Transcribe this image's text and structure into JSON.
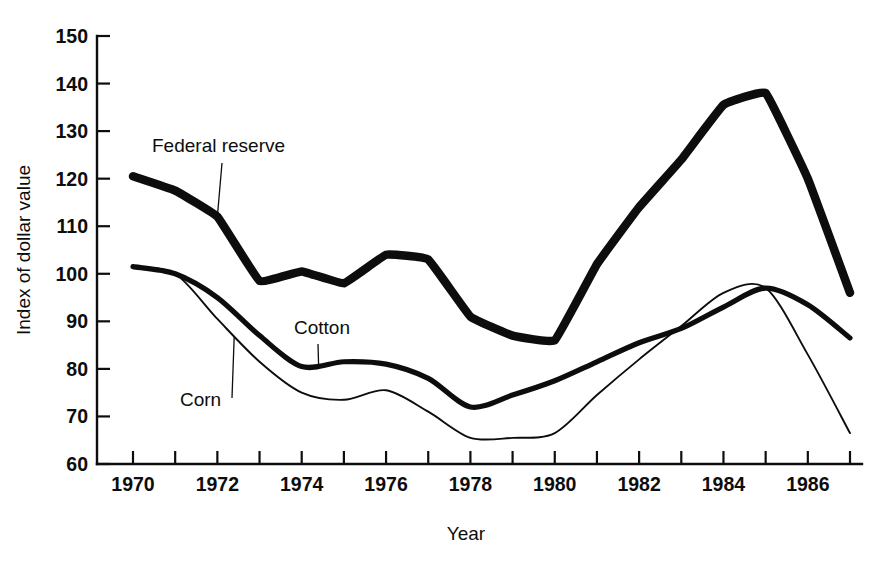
{
  "chart_data": {
    "type": "line",
    "title": "",
    "xlabel": "Year",
    "ylabel": "Index of dollar value",
    "xlim": [
      1970,
      1987
    ],
    "ylim": [
      60,
      150
    ],
    "grid": false,
    "legend_position": "inline-annotations",
    "x": [
      1970,
      1971,
      1972,
      1973,
      1974,
      1975,
      1976,
      1977,
      1978,
      1979,
      1980,
      1981,
      1982,
      1983,
      1984,
      1985,
      1986,
      1987
    ],
    "x_tick_labels": [
      "1970",
      "",
      "1972",
      "",
      "1974",
      "",
      "1976",
      "",
      "1978",
      "",
      "1980",
      "",
      "1982",
      "",
      "1984",
      "",
      "1986",
      ""
    ],
    "x_major_labels": [
      "1970",
      "1972",
      "1974",
      "1976",
      "1978",
      "1980",
      "1982",
      "1984",
      "1986"
    ],
    "y_ticks": [
      60,
      70,
      80,
      90,
      100,
      110,
      120,
      130,
      140,
      150
    ],
    "y_tick_labels": [
      "60",
      "70",
      "80",
      "90",
      "100",
      "110",
      "120",
      "130",
      "140",
      "150"
    ],
    "series": [
      {
        "name": "Federal reserve",
        "line_weight": "thick",
        "color": "#0d0d0d",
        "values": [
          120.5,
          117.5,
          112.0,
          98.5,
          100.5,
          98.0,
          104.0,
          103.0,
          91.0,
          87.0,
          86.0,
          102.0,
          114.0,
          124.0,
          135.5,
          138.0,
          120.0,
          96.0
        ]
      },
      {
        "name": "Cotton",
        "line_weight": "medium",
        "color": "#0d0d0d",
        "values": [
          101.5,
          100.0,
          95.0,
          87.0,
          80.5,
          81.5,
          81.0,
          78.0,
          72.0,
          74.5,
          77.5,
          81.5,
          85.5,
          88.5,
          93.0,
          97.0,
          93.5,
          86.5
        ]
      },
      {
        "name": "Corn",
        "line_weight": "thin",
        "color": "#0d0d0d",
        "values": [
          101.5,
          100.0,
          90.5,
          81.5,
          75.0,
          73.5,
          75.5,
          71.0,
          65.5,
          65.5,
          66.5,
          74.5,
          82.0,
          89.0,
          96.0,
          97.0,
          83.0,
          66.5
        ]
      }
    ],
    "annotations": [
      {
        "text": "Federal reserve",
        "points_to_series": "Federal reserve",
        "points_to_x": 1972
      },
      {
        "text": "Cotton",
        "points_to_series": "Cotton",
        "points_to_x": 1974.4
      },
      {
        "text": "Corn",
        "points_to_series": "Corn",
        "points_to_x": 1972.4
      }
    ]
  },
  "axes": {
    "y_title": "Index of dollar value",
    "x_title": "Year"
  }
}
